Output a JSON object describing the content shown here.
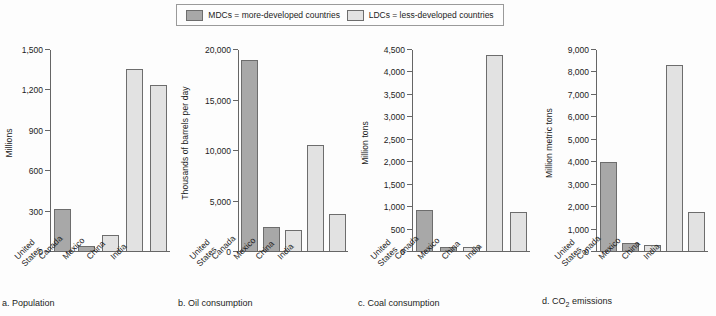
{
  "legend": {
    "entries": [
      {
        "key": "mdc",
        "label": "MDCs = more-developed countries",
        "color": "#a8a8a8"
      },
      {
        "key": "ldc",
        "label": "LDCs = less-developed countries",
        "color": "#e2e2e2"
      }
    ]
  },
  "colors": {
    "mdc_fill": "#a8a8a8",
    "ldc_fill": "#e2e2e2",
    "bar_stroke": "#6d6d6d",
    "axis": "#666666",
    "background": "#fdfdfd",
    "text": "#1c1c1c"
  },
  "categories": [
    "United States",
    "Canada",
    "Mexico",
    "China",
    "India"
  ],
  "category_groups": [
    "mdc",
    "mdc",
    "ldc",
    "ldc",
    "ldc"
  ],
  "chart_data": [
    {
      "id": "a",
      "type": "bar",
      "title": "a. Population",
      "caption": "a. Population",
      "xlabel": "",
      "ylabel": "Millions",
      "categories": [
        "United States",
        "Canada",
        "Mexico",
        "China",
        "India"
      ],
      "values": [
        315,
        34,
        117,
        1355,
        1240
      ],
      "groups": [
        "mdc",
        "mdc",
        "ldc",
        "ldc",
        "ldc"
      ],
      "ylim": [
        0,
        1500
      ],
      "yticks": [
        0,
        300,
        600,
        900,
        1200,
        1500
      ],
      "ytick_labels": [
        "0",
        "300",
        "600",
        "900",
        "1,200",
        "1,500"
      ],
      "grid": false,
      "legend_position": "top-center"
    },
    {
      "id": "b",
      "type": "bar",
      "title": "b. Oil consumption",
      "caption": "b. Oil consumption",
      "xlabel": "",
      "ylabel": "Thousands of barrels per day",
      "categories": [
        "United States",
        "Canada",
        "Mexico",
        "China",
        "India"
      ],
      "values": [
        19000,
        2350,
        2050,
        10500,
        3650
      ],
      "groups": [
        "mdc",
        "mdc",
        "ldc",
        "ldc",
        "ldc"
      ],
      "ylim": [
        0,
        20000
      ],
      "yticks": [
        0,
        5000,
        10000,
        15000,
        20000
      ],
      "ytick_labels": [
        "0",
        "5,000",
        "10,000",
        "15,000",
        "20,000"
      ],
      "grid": false,
      "legend_position": "top-center"
    },
    {
      "id": "c",
      "type": "bar",
      "title": "c. Coal consumption",
      "caption": "c. Coal consumption",
      "xlabel": "",
      "ylabel": "Million tons",
      "categories": [
        "United States",
        "Canada",
        "Mexico",
        "China",
        "India"
      ],
      "values": [
        920,
        40,
        20,
        4380,
        870
      ],
      "groups": [
        "mdc",
        "mdc",
        "ldc",
        "ldc",
        "ldc"
      ],
      "ylim": [
        0,
        4500
      ],
      "yticks": [
        0,
        500,
        1000,
        1500,
        2000,
        2500,
        3000,
        3500,
        4000,
        4500
      ],
      "ytick_labels": [
        "0",
        "500",
        "1,000",
        "1,500",
        "2,000",
        "2,500",
        "3,000",
        "3,500",
        "4,000",
        "4,500"
      ],
      "grid": false,
      "legend_position": "top-center"
    },
    {
      "id": "d",
      "type": "bar",
      "title": "d. CO2 emissions",
      "caption_prefix": "d. CO",
      "caption_sub": "2",
      "caption_suffix": " emissions",
      "xlabel": "",
      "ylabel": "Million metric tons",
      "categories": [
        "United States",
        "Canada",
        "Mexico",
        "China",
        "India"
      ],
      "values": [
        3980,
        340,
        290,
        8330,
        1740
      ],
      "groups": [
        "mdc",
        "mdc",
        "ldc",
        "ldc",
        "ldc"
      ],
      "ylim": [
        0,
        9000
      ],
      "yticks": [
        0,
        1000,
        2000,
        3000,
        4000,
        5000,
        6000,
        7000,
        8000,
        9000
      ],
      "ytick_labels": [
        "0",
        "1,000",
        "2,000",
        "3,000",
        "4,000",
        "5,000",
        "6,000",
        "7,000",
        "8,000",
        "9,000"
      ],
      "grid": false,
      "legend_position": "top-center"
    }
  ]
}
